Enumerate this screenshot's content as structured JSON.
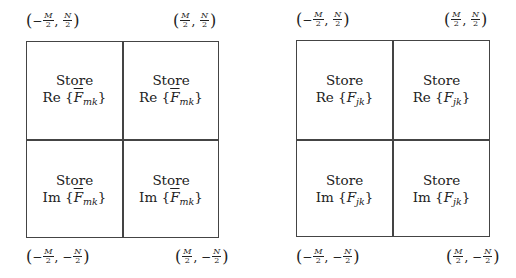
{
  "diagrams": [
    {
      "id": "left",
      "corners": {
        "top_left": {
          "sign_m": "−",
          "m": "M",
          "d": "2",
          "sep": ",",
          "sign_n": "",
          "n": "N"
        },
        "top_right": {
          "sign_m": "",
          "m": "M",
          "d": "2",
          "sep": ",",
          "sign_n": "",
          "n": "N"
        },
        "bottom_left": {
          "sign_m": "−",
          "m": "M",
          "d": "2",
          "sep": ",",
          "sign_n": "−",
          "n": "N"
        },
        "bottom_right": {
          "sign_m": "",
          "m": "M",
          "d": "2",
          "sep": ",",
          "sign_n": "−",
          "n": "N"
        }
      },
      "cells": [
        {
          "line1": "Store",
          "op": "Re",
          "var": "F",
          "overline": true,
          "sub": "mk"
        },
        {
          "line1": "Store",
          "op": "Re",
          "var": "F",
          "overline": true,
          "sub": "mk"
        },
        {
          "line1": "Store",
          "op": "Im",
          "var": "F",
          "overline": true,
          "sub": "mk"
        },
        {
          "line1": "Store",
          "op": "Im",
          "var": "F",
          "overline": true,
          "sub": "mk"
        }
      ]
    },
    {
      "id": "right",
      "corners": {
        "top_left": {
          "sign_m": "−",
          "m": "M",
          "d": "2",
          "sep": ",",
          "sign_n": "",
          "n": "N"
        },
        "top_right": {
          "sign_m": "",
          "m": "M",
          "d": "2",
          "sep": ",",
          "sign_n": "",
          "n": "N"
        },
        "bottom_left": {
          "sign_m": "−",
          "m": "M",
          "d": "2",
          "sep": ",",
          "sign_n": "−",
          "n": "N"
        },
        "bottom_right": {
          "sign_m": "",
          "m": "M",
          "d": "2",
          "sep": ",",
          "sign_n": "−",
          "n": "N"
        }
      },
      "cells": [
        {
          "line1": "Store",
          "op": "Re",
          "var": "F",
          "overline": false,
          "sub": "jk"
        },
        {
          "line1": "Store",
          "op": "Re",
          "var": "F",
          "overline": false,
          "sub": "jk"
        },
        {
          "line1": "Store",
          "op": "Im",
          "var": "F",
          "overline": false,
          "sub": "jk"
        },
        {
          "line1": "Store",
          "op": "Im",
          "var": "F",
          "overline": false,
          "sub": "jk"
        }
      ]
    }
  ],
  "symbols": {
    "lparen": "(",
    "rparen": ")",
    "lbrace": "{",
    "rbrace": "}"
  }
}
